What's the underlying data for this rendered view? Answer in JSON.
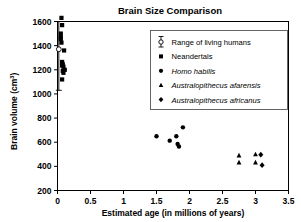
{
  "chart_data": {
    "type": "scatter",
    "title": "Brain Size Comparison",
    "xlabel": "Estimated age (in millions of years)",
    "ylabel": "Brain volume (cm",
    "ylabel_superscript": "3",
    "ylabel_suffix": ")",
    "xlim": [
      0,
      3.5
    ],
    "ylim": [
      200,
      1600
    ],
    "xticks": [
      "0",
      "0.5",
      "1",
      "1.5",
      "2",
      "2.5",
      "3",
      "3.5"
    ],
    "xtick_values": [
      0,
      0.5,
      1,
      1.5,
      2,
      2.5,
      3,
      3.5
    ],
    "yticks": [
      "200",
      "400",
      "600",
      "800",
      "1000",
      "1200",
      "1400",
      "1600"
    ],
    "ytick_values": [
      200,
      400,
      600,
      800,
      1000,
      1200,
      1400,
      1600
    ],
    "grid": false,
    "legend_position": "upper right",
    "series": [
      {
        "name": "Range of living humans",
        "marker": "open-circle-errorbar",
        "points": [
          {
            "x": 0.02,
            "y": 1370
          }
        ],
        "error_bar": {
          "x": 0.02,
          "y_low": 1030,
          "y_high": 1600
        }
      },
      {
        "name": "Neandertals",
        "marker": "square",
        "points": [
          {
            "x": 0.06,
            "y": 1630
          },
          {
            "x": 0.07,
            "y": 1570
          },
          {
            "x": 0.05,
            "y": 1500
          },
          {
            "x": 0.05,
            "y": 1470
          },
          {
            "x": 0.05,
            "y": 1455
          },
          {
            "x": 0.06,
            "y": 1425
          },
          {
            "x": 0.1,
            "y": 1360
          },
          {
            "x": 0.07,
            "y": 1265
          },
          {
            "x": 0.08,
            "y": 1245
          },
          {
            "x": 0.07,
            "y": 1235
          },
          {
            "x": 0.09,
            "y": 1225
          },
          {
            "x": 0.11,
            "y": 1200
          },
          {
            "x": 0.08,
            "y": 1190
          },
          {
            "x": 0.09,
            "y": 1175
          },
          {
            "x": 0.07,
            "y": 1120
          }
        ]
      },
      {
        "name": "Homo habilis",
        "marker": "circle",
        "points": [
          {
            "x": 1.5,
            "y": 650
          },
          {
            "x": 1.7,
            "y": 613
          },
          {
            "x": 1.8,
            "y": 650
          },
          {
            "x": 1.82,
            "y": 585
          },
          {
            "x": 1.84,
            "y": 565
          },
          {
            "x": 1.9,
            "y": 723
          }
        ]
      },
      {
        "name": "Australopithecus afarensis",
        "marker": "triangle",
        "points": [
          {
            "x": 2.75,
            "y": 490
          },
          {
            "x": 2.75,
            "y": 432
          },
          {
            "x": 3.0,
            "y": 500
          },
          {
            "x": 3.0,
            "y": 432
          }
        ]
      },
      {
        "name": "Australopithecus africanus",
        "marker": "diamond",
        "points": [
          {
            "x": 3.08,
            "y": 497
          },
          {
            "x": 3.1,
            "y": 410
          }
        ]
      }
    ]
  },
  "legend": {
    "entries": [
      {
        "label": "Range of living humans",
        "italic": false,
        "marker": "errorbar-open-circle"
      },
      {
        "label": "Neandertals",
        "italic": false,
        "marker": "square"
      },
      {
        "label": "Homo habilis",
        "italic": true,
        "marker": "circle"
      },
      {
        "label": "Australopithecus afarensis",
        "italic": true,
        "marker": "triangle"
      },
      {
        "label": "Australopithecus africanus",
        "italic": true,
        "marker": "diamond"
      }
    ]
  }
}
